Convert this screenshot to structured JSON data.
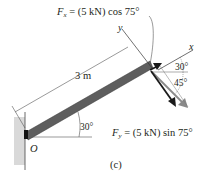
{
  "figure": {
    "caption": "(c)",
    "labels": {
      "fx_symbol": "F",
      "fx_sub": "x",
      "fx_rest": " = (5 kN) cos 75°",
      "fy_symbol": "F",
      "fy_sub": "y",
      "fy_rest": " = (5 kN) sin 75°",
      "length": "3 m",
      "origin": "O",
      "axis_x": "x",
      "axis_y": "y",
      "angle_beam": "30°",
      "angle_top": "30°",
      "angle_force": "45°"
    },
    "colors": {
      "beam": "#5a5a5a",
      "wall": "#c8c8c8",
      "arrow_dark": "#1a1a1a",
      "arrow_light": "#8a8a8a",
      "line": "#555555"
    }
  }
}
